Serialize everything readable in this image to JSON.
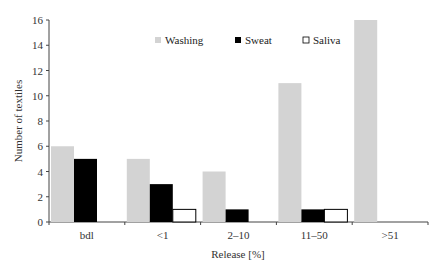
{
  "chart_data": {
    "type": "bar",
    "title": "",
    "xlabel": "Release [%]",
    "ylabel": "Number of textiles",
    "categories": [
      "bdl",
      "<1",
      "2–10",
      "11–50",
      ">51"
    ],
    "series": [
      {
        "name": "Washing",
        "color": "#d3d3d3",
        "values": [
          6,
          5,
          4,
          11,
          16
        ]
      },
      {
        "name": "Sweat",
        "color": "#000000",
        "values": [
          5,
          3,
          1,
          1,
          0
        ]
      },
      {
        "name": "Saliva",
        "color": "#ffffff",
        "values": [
          0,
          1,
          0,
          1,
          0
        ]
      }
    ],
    "ylim": [
      0,
      16
    ],
    "yticks": [
      0,
      2,
      4,
      6,
      8,
      10,
      12,
      14,
      16
    ],
    "grid": false,
    "legend_position": "top-center"
  },
  "legend": {
    "items": [
      {
        "label": "Washing",
        "color": "#d3d3d3",
        "icon": "square-filled-gray-icon"
      },
      {
        "label": "Sweat",
        "color": "#000000",
        "icon": "square-filled-black-icon"
      },
      {
        "label": "Saliva",
        "color": "#ffffff",
        "icon": "square-outline-icon"
      }
    ]
  }
}
